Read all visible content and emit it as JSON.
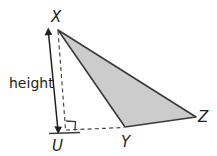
{
  "figure": {
    "background_color": "#ffffff",
    "stroke_color": "#3a3a3a",
    "shade_color": "#cccccc",
    "labels": {
      "vertex_x": "X",
      "vertex_y": "Y",
      "vertex_z": "Z",
      "foot_u": "U",
      "height": "height"
    },
    "geometry": {
      "points": {
        "X": [
          58,
          30
        ],
        "Y": [
          125,
          127
        ],
        "Z": [
          196,
          117
        ],
        "U": [
          65,
          129
        ]
      },
      "height_arrow": {
        "from": [
          48,
          31
        ],
        "to": [
          58,
          131
        ]
      },
      "base_extension": {
        "from": [
          65,
          130
        ],
        "to": [
          125,
          127
        ]
      },
      "base_tick": {
        "from": [
          50,
          133
        ],
        "to": [
          80,
          132
        ]
      },
      "right_angle_marker": {
        "corner": [
          66,
          130
        ],
        "size": 9
      }
    }
  }
}
